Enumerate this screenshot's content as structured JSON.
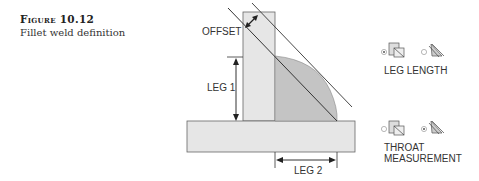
{
  "caption": {
    "figure_number": "Figure 10.12",
    "text": "Fillet weld definition"
  },
  "diagram": {
    "labels": {
      "offset": "OFFSET",
      "leg1": "LEG 1",
      "leg2": "LEG 2"
    },
    "colors": {
      "plate_fill": "#e6e6e6",
      "weld_fill": "#c4c4c4",
      "line": "#333333"
    }
  },
  "options": {
    "leg_length": {
      "label": "LEG LENGTH",
      "left_radio_selected": true,
      "right_radio_selected": false
    },
    "throat_measurement": {
      "label_line1": "THROAT",
      "label_line2": "MEASUREMENT",
      "left_radio_selected": false,
      "right_radio_selected": true
    }
  }
}
